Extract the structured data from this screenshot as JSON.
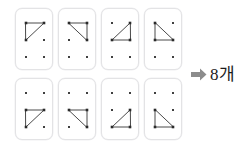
{
  "diagram": {
    "card_count": 8,
    "dot_grid": {
      "columns": 2,
      "rows": 3,
      "dot_color": "#2b2b2b",
      "dot_positions": [
        {
          "id": "TL",
          "x": 10,
          "y": 14
        },
        {
          "id": "TR",
          "x": 28,
          "y": 14
        },
        {
          "id": "ML",
          "x": 10,
          "y": 31
        },
        {
          "id": "MR",
          "x": 28,
          "y": 31
        },
        {
          "id": "BL",
          "x": 10,
          "y": 48
        },
        {
          "id": "BR",
          "x": 28,
          "y": 48
        }
      ]
    },
    "edge_color": "#4a4a4a",
    "card_border_color": "#e3e3e5",
    "cards": [
      {
        "index": 1,
        "name": "card-1",
        "vertices": [
          "TL",
          "TR",
          "ML"
        ],
        "description": "Right triangle on top-left, top-right, middle-left dots"
      },
      {
        "index": 2,
        "name": "card-2",
        "vertices": [
          "TL",
          "TR",
          "MR"
        ],
        "description": "Right triangle on top-left, top-right, middle-right dots"
      },
      {
        "index": 3,
        "name": "card-3",
        "vertices": [
          "TR",
          "ML",
          "MR"
        ],
        "description": "Right triangle on top-right, middle-left, middle-right dots"
      },
      {
        "index": 4,
        "name": "card-4",
        "vertices": [
          "TL",
          "ML",
          "MR"
        ],
        "description": "Right triangle on top-left, middle-left, middle-right dots"
      },
      {
        "index": 5,
        "name": "card-5",
        "vertices": [
          "ML",
          "MR",
          "BL"
        ],
        "description": "Right triangle on middle-left, middle-right, bottom-left dots"
      },
      {
        "index": 6,
        "name": "card-6",
        "vertices": [
          "ML",
          "MR",
          "BR"
        ],
        "description": "Right triangle on middle-left, middle-right, bottom-right dots"
      },
      {
        "index": 7,
        "name": "card-7",
        "vertices": [
          "MR",
          "BL",
          "BR"
        ],
        "description": "Right triangle on middle-right, bottom-left, bottom-right dots"
      },
      {
        "index": 8,
        "name": "card-8",
        "vertices": [
          "ML",
          "BL",
          "BR"
        ],
        "description": "Right triangle on middle-left, bottom-left, bottom-right dots"
      }
    ]
  },
  "result": {
    "arrow_icon": "arrow-right-icon",
    "arrow_color": "#8c8c8c",
    "label": "8개"
  }
}
